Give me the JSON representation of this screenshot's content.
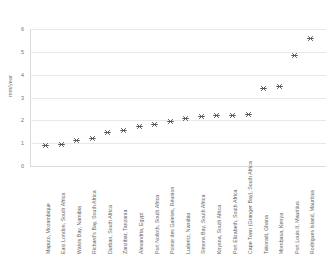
{
  "chart_data": {
    "type": "scatter",
    "title": "",
    "xlabel": "",
    "ylabel": "mm/year",
    "ylim": [
      0,
      6
    ],
    "yticks": [
      0,
      1,
      2,
      3,
      4,
      5,
      6
    ],
    "ytick_labels": [
      "0",
      "1",
      "2",
      "3",
      "4",
      "5",
      "6"
    ],
    "grid": true,
    "legend": "none",
    "marker": "asterisk",
    "marker_color": "#4a4a4a",
    "grid_color": "#e8e8e8",
    "categories": [
      "Maputo, Mozambique",
      "East London, South Africa",
      "Walvis Bay, Namibia",
      "Richard's Bay, South Africa",
      "Durban, South Africa",
      "Zanzibar, Tanzania",
      "Alexandria, Egypt",
      "Port Nolloth, South Africa",
      "Pointe des Galetes, Réunion",
      "Luderitz, Namibia",
      "Simons Bay, South Africa",
      "Knysna, South Africa",
      "Port Elizabeth, South Africa",
      "Cape Town (Granger Bay), South Africa",
      "Takoradi, Ghana",
      "Mombasa, Kenya",
      "Port Louis II, Mauritius",
      "Rodrigues Island, Mauritius"
    ],
    "values": [
      0.9,
      0.95,
      1.1,
      1.2,
      1.45,
      1.55,
      1.75,
      1.8,
      1.95,
      2.1,
      2.15,
      2.2,
      2.2,
      2.25,
      3.4,
      3.5,
      4.85,
      5.6
    ]
  }
}
